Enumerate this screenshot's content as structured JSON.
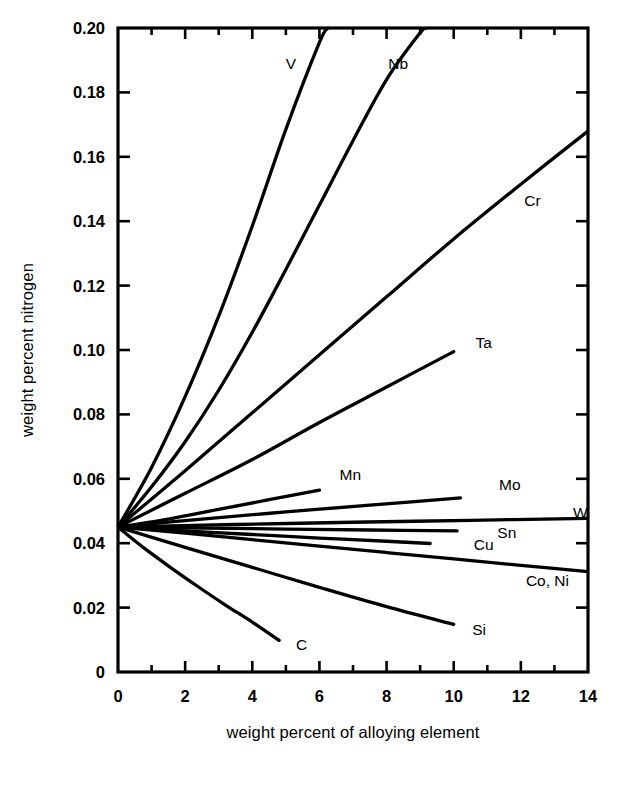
{
  "figure": {
    "background_color": "#ffffff",
    "ink_color": "#000000",
    "y_axis_title": "weight percent nitrogen",
    "x_axis_title": "weight percent of alloying element"
  },
  "chart_data": {
    "type": "line",
    "title": "",
    "subtitle": "",
    "xlabel": "weight percent of alloying element",
    "ylabel": "weight percent nitrogen",
    "xlim": [
      0,
      14
    ],
    "ylim": [
      0,
      0.2
    ],
    "grid": false,
    "legend": "inline-curve-labels",
    "x_ticks_major": [
      0,
      2,
      4,
      6,
      8,
      10,
      12,
      14
    ],
    "x_ticks_minor": [
      1,
      3,
      5,
      7,
      9,
      11,
      13
    ],
    "x_tick_labels": [
      "0",
      "2",
      "4",
      "6",
      "8",
      "10",
      "12",
      "14"
    ],
    "y_ticks_major": [
      0,
      0.02,
      0.04,
      0.06,
      0.08,
      0.1,
      0.12,
      0.14,
      0.16,
      0.18,
      0.2
    ],
    "y_tick_labels": [
      "0",
      "0.02",
      "0.04",
      "0.06",
      "0.08",
      "0.10",
      "0.12",
      "0.14",
      "0.16",
      "0.18",
      "0.20"
    ],
    "common_origin": {
      "x": 0,
      "y": 0.045
    },
    "series": [
      {
        "name": "V",
        "label": "V",
        "label_pos": {
          "x": 5.0,
          "y": 0.189
        },
        "points": [
          [
            0,
            0.045
          ],
          [
            1,
            0.0635
          ],
          [
            2,
            0.0855
          ],
          [
            3,
            0.1105
          ],
          [
            4,
            0.1385
          ],
          [
            5,
            0.1685
          ],
          [
            6,
            0.1955
          ],
          [
            6.25,
            0.2
          ]
        ]
      },
      {
        "name": "Nb",
        "label": "Nb",
        "label_pos": {
          "x": 8.05,
          "y": 0.189
        },
        "points": [
          [
            0,
            0.045
          ],
          [
            1,
            0.0575
          ],
          [
            2,
            0.0715
          ],
          [
            3,
            0.0875
          ],
          [
            4,
            0.1055
          ],
          [
            5,
            0.125
          ],
          [
            6,
            0.145
          ],
          [
            7,
            0.165
          ],
          [
            8,
            0.184
          ],
          [
            9,
            0.1985
          ],
          [
            9.2,
            0.2
          ]
        ]
      },
      {
        "name": "Cr",
        "label": "Cr",
        "label_pos": {
          "x": 12.1,
          "y": 0.1465
        },
        "points": [
          [
            0,
            0.045
          ],
          [
            2,
            0.0625
          ],
          [
            4,
            0.0805
          ],
          [
            6,
            0.0985
          ],
          [
            8,
            0.1165
          ],
          [
            10,
            0.1345
          ],
          [
            12,
            0.1515
          ],
          [
            14,
            0.168
          ]
        ]
      },
      {
        "name": "Ta",
        "label": "Ta",
        "label_pos": {
          "x": 10.65,
          "y": 0.1025
        },
        "points": [
          [
            0,
            0.045
          ],
          [
            2,
            0.0555
          ],
          [
            4,
            0.066
          ],
          [
            6,
            0.0775
          ],
          [
            8,
            0.0885
          ],
          [
            10,
            0.0995
          ]
        ]
      },
      {
        "name": "Mn",
        "label": "Mn",
        "label_pos": {
          "x": 6.6,
          "y": 0.0615
        },
        "points": [
          [
            0,
            0.045
          ],
          [
            1.5,
            0.0475
          ],
          [
            3,
            0.0505
          ],
          [
            4.5,
            0.0535
          ],
          [
            6,
            0.0565
          ]
        ]
      },
      {
        "name": "Mo",
        "label": "Mo",
        "label_pos": {
          "x": 11.35,
          "y": 0.0585
        },
        "points": [
          [
            0,
            0.045
          ],
          [
            2.5,
            0.0475
          ],
          [
            5,
            0.0497
          ],
          [
            7.5,
            0.0518
          ],
          [
            10.2,
            0.0541
          ]
        ]
      },
      {
        "name": "W",
        "label": "W",
        "label_pos": {
          "x": 13.55,
          "y": 0.0498
        },
        "points": [
          [
            0,
            0.045
          ],
          [
            3.5,
            0.0458
          ],
          [
            7,
            0.0465
          ],
          [
            10.5,
            0.0471
          ],
          [
            14,
            0.0477
          ]
        ]
      },
      {
        "name": "Sn",
        "label": "Sn",
        "label_pos": {
          "x": 11.3,
          "y": 0.0436
        },
        "points": [
          [
            0,
            0.045
          ],
          [
            2.5,
            0.0447
          ],
          [
            5,
            0.0444
          ],
          [
            7.5,
            0.0441
          ],
          [
            10.1,
            0.0438
          ]
        ]
      },
      {
        "name": "Cu",
        "label": "Cu",
        "label_pos": {
          "x": 10.6,
          "y": 0.0398
        },
        "points": [
          [
            0,
            0.045
          ],
          [
            2,
            0.0438
          ],
          [
            4,
            0.0427
          ],
          [
            6,
            0.0416
          ],
          [
            8,
            0.0406
          ],
          [
            9.3,
            0.0399
          ]
        ]
      },
      {
        "name": "Co, Ni",
        "label": "Co, Ni",
        "label_pos": {
          "x": 12.15,
          "y": 0.0286
        },
        "points": [
          [
            0,
            0.045
          ],
          [
            2,
            0.0431
          ],
          [
            4,
            0.0411
          ],
          [
            6,
            0.0391
          ],
          [
            8,
            0.0371
          ],
          [
            10,
            0.0351
          ],
          [
            12,
            0.0331
          ],
          [
            14,
            0.0312
          ]
        ]
      },
      {
        "name": "Si",
        "label": "Si",
        "label_pos": {
          "x": 10.55,
          "y": 0.0135
        },
        "points": [
          [
            0,
            0.045
          ],
          [
            2,
            0.0387
          ],
          [
            4,
            0.0325
          ],
          [
            6,
            0.0263
          ],
          [
            8,
            0.0203
          ],
          [
            10,
            0.0148
          ]
        ]
      },
      {
        "name": "C",
        "label": "C",
        "label_pos": {
          "x": 5.3,
          "y": 0.0088
        },
        "points": [
          [
            0,
            0.045
          ],
          [
            0.8,
            0.0383
          ],
          [
            1.6,
            0.0322
          ],
          [
            2.4,
            0.0264
          ],
          [
            3.2,
            0.0208
          ],
          [
            4.0,
            0.0155
          ],
          [
            4.8,
            0.0098
          ]
        ]
      }
    ]
  }
}
